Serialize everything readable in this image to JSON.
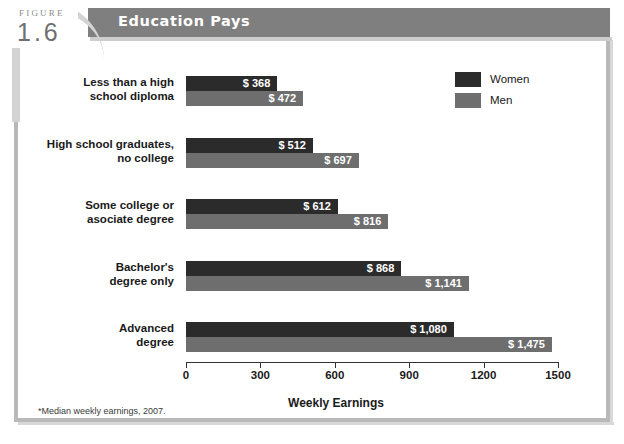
{
  "figure": {
    "label": "FIGURE",
    "number": "1.6",
    "title": "Education Pays"
  },
  "footnote": "*Median weekly earnings, 2007.",
  "legend": {
    "position": "top-right",
    "entries": [
      {
        "label": "Women",
        "color": "#2b2b2b",
        "swatch": "women"
      },
      {
        "label": "Men",
        "color": "#6e6e6e",
        "swatch": "men"
      }
    ]
  },
  "chart_data": {
    "type": "bar",
    "orientation": "horizontal",
    "title": "Education Pays",
    "xlabel": "Weekly Earnings",
    "ylabel": "",
    "xlim": [
      0,
      1500
    ],
    "xticks": [
      0,
      300,
      600,
      900,
      1200,
      1500
    ],
    "xtick_labels": [
      "0",
      "300",
      "600",
      "900",
      "1200",
      "1500"
    ],
    "grid": false,
    "legend_position": "top-right",
    "categories": [
      "Less than a high\nschool diploma",
      "High school graduates,\nno college",
      "Some college or\nasociate degree",
      "Bachelor's\ndegree only",
      "Advanced\ndegree"
    ],
    "series": [
      {
        "name": "Women",
        "color": "#2b2b2b",
        "values": [
          368,
          512,
          612,
          868,
          1080
        ],
        "labels": [
          "$ 368",
          "$ 512",
          "$ 612",
          "$ 868",
          "$ 1,080"
        ]
      },
      {
        "name": "Men",
        "color": "#6e6e6e",
        "values": [
          472,
          697,
          816,
          1141,
          1475
        ],
        "labels": [
          "$ 472",
          "$ 697",
          "$ 816",
          "$ 1,141",
          "$ 1,475"
        ]
      }
    ],
    "note": "*Median weekly earnings, 2007."
  },
  "colors": {
    "header_band": "#7f7f7f",
    "frame": "#b9b9b9",
    "women_bar": "#2b2b2b",
    "men_bar": "#6e6e6e",
    "background": "#ffffff"
  }
}
